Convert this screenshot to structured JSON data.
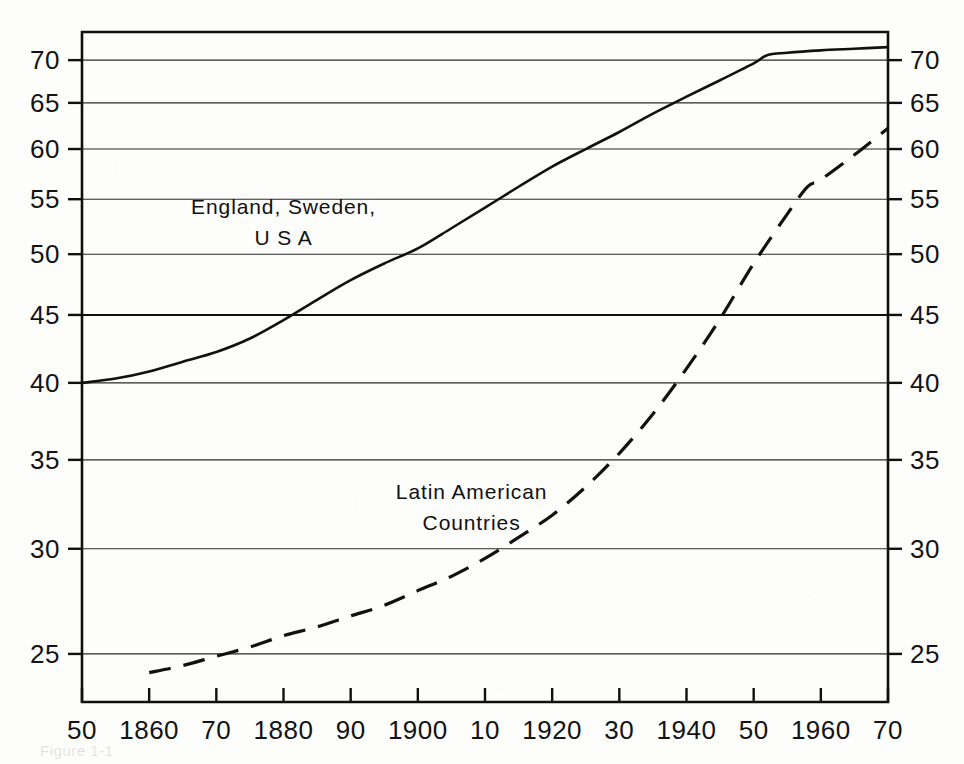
{
  "chart_data": {
    "type": "line",
    "title": "",
    "subtitle": "",
    "xlabel": "",
    "ylabel": "",
    "yscale": "log",
    "xscale": "linear",
    "xlim": [
      1850,
      1970
    ],
    "ylim": [
      23.0,
      73.5
    ],
    "grid": true,
    "grid_axis": "y",
    "legend_position": "inline-annotations",
    "y_ticks": [
      25,
      30,
      35,
      40,
      45,
      50,
      55,
      60,
      65,
      70
    ],
    "y_tick_labels": [
      "25",
      "30",
      "35",
      "40",
      "45",
      "50",
      "55",
      "60",
      "65",
      "70"
    ],
    "y_axis_duplicated_right": true,
    "x_ticks": [
      1850,
      1860,
      1870,
      1880,
      1890,
      1900,
      1910,
      1920,
      1930,
      1940,
      1950,
      1960,
      1970
    ],
    "x_tick_labels": [
      "50",
      "1860",
      "70",
      "1880",
      "90",
      "1900",
      "10",
      "1920",
      "30",
      "1940",
      "50",
      "1960",
      "70"
    ],
    "series": [
      {
        "name": "England, Sweden, U S A",
        "label_lines": [
          "England, Sweden,",
          "U S A"
        ],
        "style": "solid",
        "color": "#111111",
        "x": [
          1850,
          1855,
          1860,
          1865,
          1870,
          1875,
          1880,
          1885,
          1890,
          1895,
          1900,
          1905,
          1910,
          1915,
          1920,
          1925,
          1930,
          1935,
          1940,
          1945,
          1950,
          1952,
          1955,
          1960,
          1965,
          1970
        ],
        "values": [
          40.0,
          40.3,
          40.8,
          41.5,
          42.2,
          43.2,
          44.6,
          46.2,
          47.8,
          49.2,
          50.5,
          52.3,
          54.2,
          56.2,
          58.2,
          60.0,
          61.8,
          63.8,
          65.7,
          67.6,
          69.6,
          70.6,
          70.9,
          71.2,
          71.4,
          71.6
        ]
      },
      {
        "name": "Latin American Countries",
        "label_lines": [
          "Latin American",
          "Countries"
        ],
        "style": "dashed",
        "color": "#111111",
        "x": [
          1860,
          1865,
          1870,
          1875,
          1880,
          1885,
          1890,
          1895,
          1900,
          1905,
          1910,
          1915,
          1920,
          1925,
          1930,
          1935,
          1940,
          1945,
          1950,
          1955,
          1958,
          1960,
          1965,
          1970
        ],
        "values": [
          24.2,
          24.5,
          24.9,
          25.3,
          25.8,
          26.2,
          26.7,
          27.2,
          27.9,
          28.6,
          29.5,
          30.6,
          31.8,
          33.4,
          35.4,
          37.9,
          41.0,
          44.7,
          49.2,
          53.6,
          56.2,
          56.9,
          59.4,
          62.2
        ]
      }
    ],
    "annotations": [
      {
        "text_lines": [
          "England, Sweden,",
          "U S A"
        ],
        "x": 1880,
        "y_top_px": 214
      },
      {
        "text_lines": [
          "Latin American",
          "Countries"
        ],
        "x": 1908,
        "y_top_px": 499
      }
    ]
  },
  "figure": {
    "caption": "Figure 1-1"
  }
}
